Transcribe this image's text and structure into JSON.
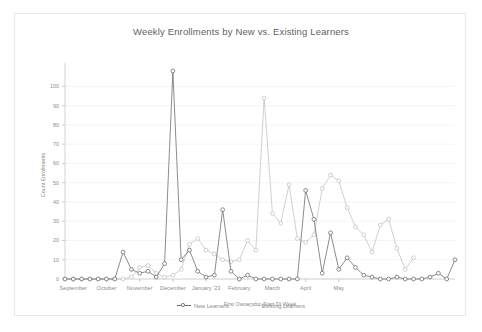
{
  "chart_data": {
    "type": "line",
    "title": "Weekly Enrollments by New vs. Existing Learners",
    "xlabel": "First Ownership Start Dt Week",
    "ylabel": "Count Enrollments",
    "ylim": [
      0,
      108
    ],
    "yticks": [
      0,
      10,
      20,
      30,
      40,
      50,
      60,
      70,
      80,
      90,
      100
    ],
    "grid": true,
    "legend_position": "bottom-center",
    "x_tick_labels": [
      "September",
      "October",
      "November",
      "December",
      "January '23",
      "February",
      "March",
      "April",
      "May"
    ],
    "x_tick_indices": [
      1,
      5,
      9,
      13,
      17,
      21,
      25,
      29,
      33
    ],
    "x": [
      0,
      1,
      2,
      3,
      4,
      5,
      6,
      7,
      8,
      9,
      10,
      11,
      12,
      13,
      14,
      15,
      16,
      17,
      18,
      19,
      20,
      21,
      22,
      23,
      24,
      25,
      26,
      27,
      28,
      29,
      30,
      31,
      32,
      33,
      34,
      35,
      36,
      37
    ],
    "series": [
      {
        "name": "New Learners",
        "color": "#6e6e6e",
        "marker": "circle-open",
        "values": [
          0,
          0,
          0,
          0,
          0,
          0,
          0,
          14,
          5,
          3,
          4,
          1,
          8,
          108,
          10,
          15,
          4,
          1,
          2,
          36,
          4,
          0,
          2,
          0,
          0,
          0,
          0,
          0,
          0,
          46,
          31,
          3,
          24,
          5,
          11,
          6,
          2,
          1
        ]
      },
      {
        "name": "Existing Learners",
        "color": "#c4c4c4",
        "marker": "circle-open",
        "values": [
          0,
          0,
          0,
          0,
          0,
          0,
          0,
          0,
          1,
          6,
          7,
          3,
          1,
          2,
          5,
          18,
          21,
          15,
          13,
          10,
          9,
          10,
          20,
          15,
          94,
          34,
          29,
          49,
          21,
          19,
          23,
          47,
          54,
          51,
          37,
          27,
          23,
          14
        ]
      }
    ],
    "series_tail": [
      {
        "name": "New Learners",
        "values": [
          0,
          0,
          1,
          0,
          0,
          0,
          1,
          3,
          0,
          10
        ]
      },
      {
        "name": "Existing Learners",
        "values": [
          28,
          31,
          16,
          5,
          11
        ]
      }
    ]
  },
  "legend": {
    "items": [
      {
        "label": "New Learners",
        "color": "#6e6e6e"
      },
      {
        "label": "Existing Learners",
        "color": "#c4c4c4"
      }
    ]
  }
}
